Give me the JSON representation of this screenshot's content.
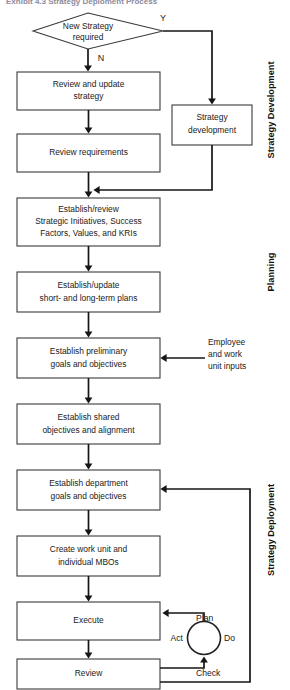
{
  "title": "Exhibit 4.3  Strategy Deploment Process",
  "decision": {
    "label_line1": "New Strategy",
    "label_line2": "required",
    "yes_label": "Y",
    "no_label": "N"
  },
  "nodes": [
    {
      "id": "review-update-strategy",
      "lines": [
        "Review and update",
        "strategy"
      ]
    },
    {
      "id": "strategy-development",
      "lines": [
        "Strategy",
        "development"
      ]
    },
    {
      "id": "review-requirements",
      "lines": [
        "Review requirements"
      ]
    },
    {
      "id": "establish-review-initiatives",
      "lines": [
        "Establish/review",
        "Strategic Initiatives, Success",
        "Factors, Values, and KRIs"
      ]
    },
    {
      "id": "establish-update-plans",
      "lines": [
        "Establish/update",
        "short- and long-term plans"
      ]
    },
    {
      "id": "establish-preliminary-goals",
      "lines": [
        "Establish preliminary",
        "goals and objectives"
      ]
    },
    {
      "id": "establish-shared-objectives",
      "lines": [
        "Establish shared",
        "objectives and alignment"
      ]
    },
    {
      "id": "establish-department-goals",
      "lines": [
        "Establish department",
        "goals and objectives"
      ]
    },
    {
      "id": "create-work-unit-mbos",
      "lines": [
        "Create work unit and",
        "individual MBOs"
      ]
    },
    {
      "id": "execute",
      "lines": [
        "Execute"
      ]
    },
    {
      "id": "review",
      "lines": [
        "Review"
      ]
    }
  ],
  "annotations": {
    "employee_inputs": [
      "Employee",
      "and work",
      "unit inputs"
    ]
  },
  "pdca": {
    "plan": "Plan",
    "do": "Do",
    "check": "Check",
    "act": "Act"
  },
  "phases": [
    {
      "id": "strategy-development",
      "label": "Strategy Development"
    },
    {
      "id": "planning",
      "label": "Planning"
    },
    {
      "id": "strategy-deployment",
      "label": "Strategy Deployment"
    }
  ],
  "colors": {
    "stroke": "#3a3a3a",
    "connector": "#161616",
    "text": "#1a1a1a",
    "background": "#ffffff",
    "title": "#8c8c9c"
  }
}
